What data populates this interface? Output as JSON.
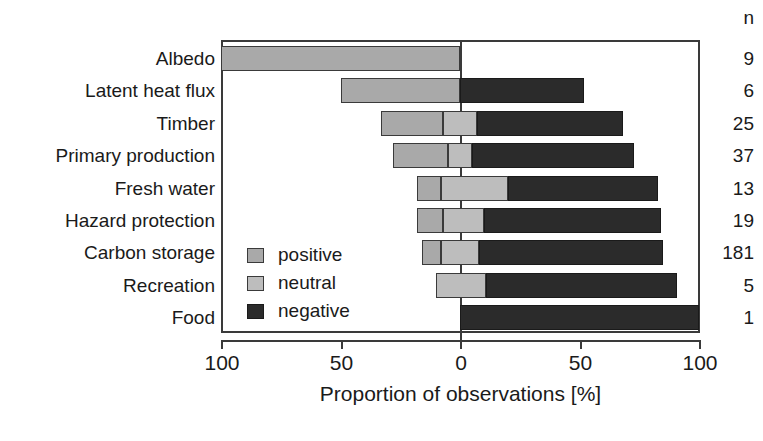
{
  "chart_data": {
    "type": "bar",
    "subtype": "diverging-stacked-horizontal",
    "title": "",
    "xlabel": "Proportion of observations [%]",
    "ylabel": "",
    "xlim": [
      -100,
      100
    ],
    "xticks": [
      100,
      50,
      0,
      50,
      100
    ],
    "xtick_labels": [
      "100",
      "50",
      "0",
      "50",
      "100"
    ],
    "grid": false,
    "legend_position": "inside-left-lower",
    "categories": [
      "Albedo",
      "Latent heat flux",
      "Timber",
      "Primary production",
      "Fresh water",
      "Hazard protection",
      "Carbon storage",
      "Recreation",
      "Food"
    ],
    "series": [
      {
        "name": "positive",
        "color": "#a9a9a9",
        "values": [
          100,
          50,
          26,
          23,
          10,
          11,
          8,
          0,
          0
        ]
      },
      {
        "name": "neutral",
        "color": "#bdbdbd",
        "values": [
          0,
          0,
          14,
          10,
          28,
          17,
          16,
          21,
          0
        ]
      },
      {
        "name": "negative",
        "color": "#2b2b2b",
        "values": [
          0,
          52,
          61,
          68,
          63,
          74,
          76,
          79,
          100
        ]
      }
    ],
    "bar_extents_percent": [
      {
        "category": "Albedo",
        "positive_start": -100,
        "positive_end": 0,
        "neutral_end": 0,
        "negative_end": 0
      },
      {
        "category": "Latent heat flux",
        "positive_start": -50,
        "positive_end": 0,
        "neutral_end": 0,
        "negative_end": 52
      },
      {
        "category": "Timber",
        "positive_start": -33,
        "positive_end": -7,
        "neutral_end": 7,
        "negative_end": 68
      },
      {
        "category": "Primary production",
        "positive_start": -28,
        "positive_end": -5,
        "neutral_end": 5,
        "negative_end": 73
      },
      {
        "category": "Fresh water",
        "positive_start": -18,
        "positive_end": -8,
        "neutral_end": 20,
        "negative_end": 83
      },
      {
        "category": "Hazard protection",
        "positive_start": -18,
        "positive_end": -7,
        "neutral_end": 10,
        "negative_end": 84
      },
      {
        "category": "Carbon storage",
        "positive_start": -16,
        "positive_end": -8,
        "neutral_end": 8,
        "negative_end": 85
      },
      {
        "category": "Recreation",
        "positive_start": -10,
        "positive_end": -10,
        "neutral_end": 11,
        "negative_end": 91
      },
      {
        "category": "Food",
        "positive_start": 0,
        "positive_end": 0,
        "neutral_end": 0,
        "negative_end": 100
      }
    ],
    "n_header": "n",
    "n_values": [
      "9",
      "6",
      "25",
      "37",
      "13",
      "19",
      "181",
      "5",
      "1"
    ],
    "legend": [
      {
        "label": "positive",
        "color": "#a9a9a9"
      },
      {
        "label": "neutral",
        "color": "#bdbdbd"
      },
      {
        "label": "negative",
        "color": "#2b2b2b"
      }
    ],
    "colors": {
      "positive": "#a9a9a9",
      "neutral": "#bdbdbd",
      "negative": "#2b2b2b",
      "axis": "#3a3a3a",
      "text": "#1a1a1a",
      "background": "#ffffff"
    }
  }
}
